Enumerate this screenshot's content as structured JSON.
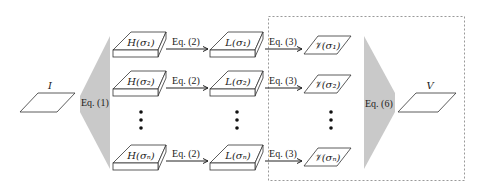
{
  "diagram": {
    "input": {
      "label": "I"
    },
    "output": {
      "label": "V"
    },
    "split_block": {
      "label": "Eq. (1)",
      "color": "#c9c9c9"
    },
    "merge_block": {
      "label": "Eq. (6)",
      "color": "#c9c9c9"
    },
    "rows": [
      {
        "h": "H(σ₁)",
        "eq_a": "Eq. (2)",
        "l": "L(σ₁)",
        "eq_b": "Eq. (3)",
        "v": "𝒱(σ₁)"
      },
      {
        "h": "H(σ₂)",
        "eq_a": "Eq. (2)",
        "l": "L(σ₂)",
        "eq_b": "Eq. (3)",
        "v": "𝒱(σ₂)"
      },
      {
        "h": "H(σₙ)",
        "eq_a": "Eq. (2)",
        "l": "L(σₙ)",
        "eq_b": "Eq. (3)",
        "v": "𝒱(σₙ)"
      }
    ],
    "ellipsis": "⋮",
    "dashed_region": {
      "style": "dashed",
      "color": "#888888"
    }
  }
}
